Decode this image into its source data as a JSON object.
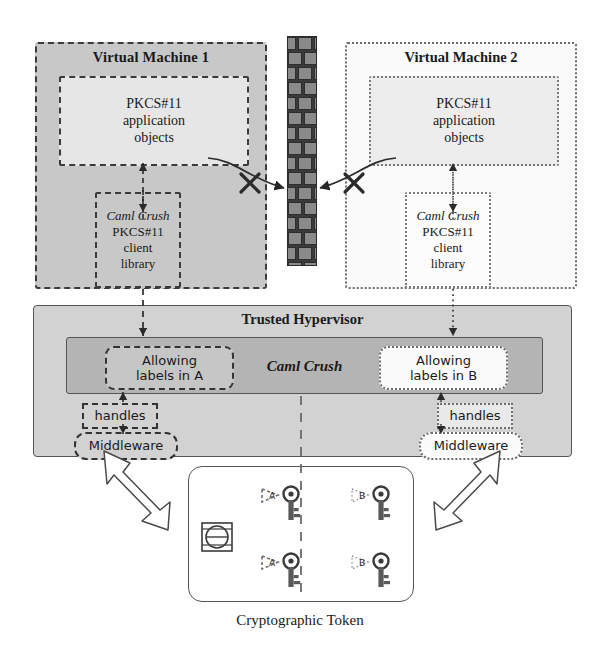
{
  "diagram": {
    "caption": "Cryptographic Token",
    "vm1": {
      "title": "Virtual Machine 1",
      "app_objects": {
        "line1": "PKCS#11",
        "line2": "application",
        "line3": "objects"
      },
      "client_library": {
        "line1": "Caml Crush",
        "line2": "PKCS#11",
        "line3": "client",
        "line4": "library"
      },
      "style": "dashed",
      "fill": "#c8c8c8"
    },
    "vm2": {
      "title": "Virtual Machine 2",
      "app_objects": {
        "line1": "PKCS#11",
        "line2": "application",
        "line3": "objects"
      },
      "client_library": {
        "line1": "Caml Crush",
        "line2": "PKCS#11",
        "line3": "client",
        "line4": "library"
      },
      "style": "dotted",
      "fill": "#fbfbfb"
    },
    "wall": {
      "name": "firewall-brick-wall",
      "brick_fill": "#8a8a8a",
      "mortar": "#2e2e2e"
    },
    "hypervisor": {
      "title": "Trusted Hypervisor",
      "caml_crush_label": "Caml Crush",
      "left": {
        "allowing_labels": {
          "line1": "Allowing",
          "line2": "labels in A"
        },
        "handles": "handles",
        "middleware": "Middleware"
      },
      "right": {
        "allowing_labels": {
          "line1": "Allowing",
          "line2": "labels in B"
        },
        "handles": "handles",
        "middleware": "Middleware"
      }
    },
    "token": {
      "left_keys": [
        {
          "label": "A",
          "tag_style": "dashed"
        },
        {
          "label": "A",
          "tag_style": "dashed"
        }
      ],
      "right_keys": [
        {
          "label": "B",
          "tag_style": "dotted"
        },
        {
          "label": "B",
          "tag_style": "dotted"
        }
      ],
      "device_icon": "token-chip-icon",
      "divider": "dashed-vertical-separator"
    },
    "arrows": {
      "vm1_to_wall": {
        "name": "blocked-arrow-left",
        "blocked": true,
        "marker": "x-cross"
      },
      "vm2_to_wall": {
        "name": "blocked-arrow-right",
        "blocked": true,
        "marker": "x-cross"
      },
      "vm1_to_hypervisor": "dashed-vertical-arrow",
      "vm2_to_hypervisor": "dotted-vertical-arrow",
      "hypervisor_to_token_left": "hollow-double-arrow",
      "hypervisor_to_token_right": "hollow-double-arrow"
    }
  }
}
